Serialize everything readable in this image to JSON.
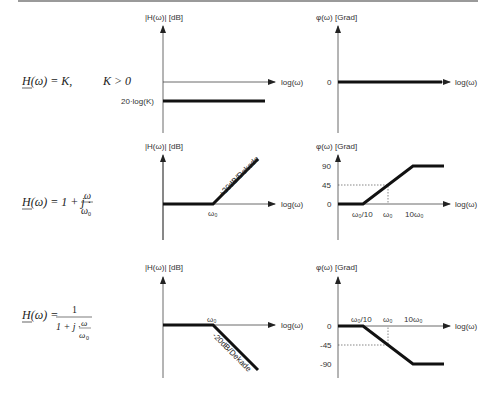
{
  "diagram": {
    "column_headers": {
      "magnitude": "|H(ω)| [dB]",
      "phase": "φ(ω) [Grad]"
    },
    "x_axis_label": "log(ω)",
    "rows": [
      {
        "formula": {
          "lhs": "H(ω) = K,",
          "rhs": "K > 0"
        },
        "magnitude": {
          "level_label": "20·log(K)",
          "break_label": "",
          "slope_label": ""
        },
        "phase": {
          "tick_labels": [
            "0"
          ],
          "x_labels": []
        }
      },
      {
        "formula": {
          "lhs": "H(ω) = 1 + j ·",
          "num": "ω",
          "den": "ω",
          "den_sub": "0"
        },
        "magnitude": {
          "break_label": "ω₀",
          "slope_label": "+20dB/Dekade"
        },
        "phase": {
          "tick_labels": [
            "90",
            "45",
            "0"
          ],
          "x_labels": [
            "ω₀/10",
            "ω₀",
            "10ω₀"
          ]
        }
      },
      {
        "formula": {
          "lhs": "H(ω) =",
          "num": "1",
          "den_pre": "1 + j ·",
          "den_frac_num": "ω",
          "den_frac_den": "ω",
          "den_frac_sub": "0"
        },
        "magnitude": {
          "break_label": "ω₀",
          "slope_label": "-20dB/Dekade"
        },
        "phase": {
          "tick_labels": [
            "0",
            "-45",
            "-90"
          ],
          "x_labels": [
            "ω₀/10",
            "ω₀",
            "10ω₀"
          ]
        }
      }
    ]
  }
}
